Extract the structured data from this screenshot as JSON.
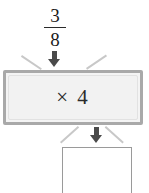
{
  "diagram": {
    "type": "function-machine",
    "input": {
      "label": "3/8",
      "numerator": "3",
      "denominator": "8"
    },
    "operation": {
      "label": "× 4",
      "operator": "×",
      "operand": "4"
    },
    "output": {
      "label": "",
      "placeholder": ""
    },
    "colors": {
      "machine_border": "#a9a9a9",
      "machine_fill": "#f2f2f2",
      "arrow": "#4a4a4a",
      "funnel_line": "#c8c8c8",
      "answer_box_border": "#9a9a9a",
      "text": "#2b2b2b"
    }
  }
}
